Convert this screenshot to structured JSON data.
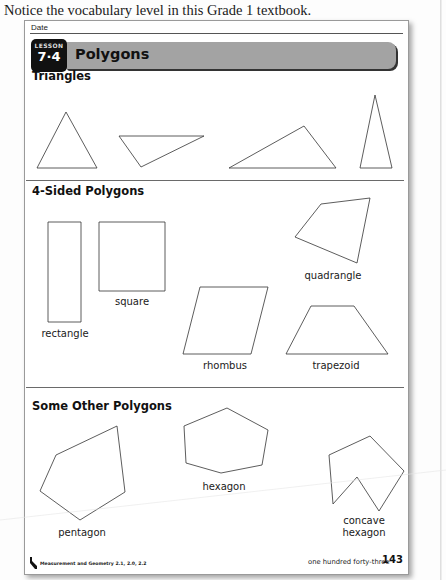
{
  "caption": "Notice the vocabulary level in this Grade 1 textbook.",
  "page": {
    "date_label": "Date",
    "lesson": {
      "word": "LESSON",
      "number": "7·4"
    },
    "title": "Polygons",
    "sections": [
      {
        "title": "Triangles",
        "shapes": [
          {
            "name": "acute triangle",
            "label": "",
            "points": "66,112 37,168 97,168"
          },
          {
            "name": "obtuse triangle",
            "label": "",
            "points": "119,136 204,136 141,167"
          },
          {
            "name": "scalene obtuse triangle",
            "label": "",
            "points": "229,168 304,126 336,168"
          },
          {
            "name": "isosceles triangle",
            "label": "",
            "points": "375,95 360,168 392,168"
          }
        ]
      },
      {
        "title": "4-Sided Polygons",
        "shapes": [
          {
            "name": "rectangle",
            "label": "rectangle",
            "points": "48,222 81,222 81,322 48,322"
          },
          {
            "name": "square",
            "label": "square",
            "points": "99,222 165,222 165,291 99,291"
          },
          {
            "name": "quadrangle",
            "label": "quadrangle",
            "points": "321,204 370,198 357,263 295,237"
          },
          {
            "name": "rhombus",
            "label": "rhombus",
            "points": "200,287 268,287 251,354 183,354"
          },
          {
            "name": "trapezoid",
            "label": "trapezoid",
            "points": "311,306 354,306 388,354 286,354"
          }
        ]
      },
      {
        "title": "Some Other Polygons",
        "shapes": [
          {
            "name": "pentagon",
            "label": "pentagon",
            "points": "56,455 117,426 125,492 80,520 40,491"
          },
          {
            "name": "hexagon",
            "label": "hexagon",
            "points": "184,426 227,408 268,430 262,465 221,473 186,463"
          },
          {
            "name": "concave hexagon",
            "label": "concave hexagon",
            "label_lines": [
              "concave",
              "hexagon"
            ],
            "points": "329,455 370,436 404,471 379,511 357,477 333,504"
          }
        ]
      }
    ],
    "footer": {
      "standards": "Measurement and Geometry 2.1, 2.0, 2.2",
      "page_words": "one hundred forty-three",
      "page_number": "143",
      "icon": "california-state-icon"
    }
  },
  "colors": {
    "title_bar": "#a3a3a3",
    "lesson_badge": "#111111",
    "shape_stroke": "#333333",
    "divider": "#6a6a6a"
  }
}
